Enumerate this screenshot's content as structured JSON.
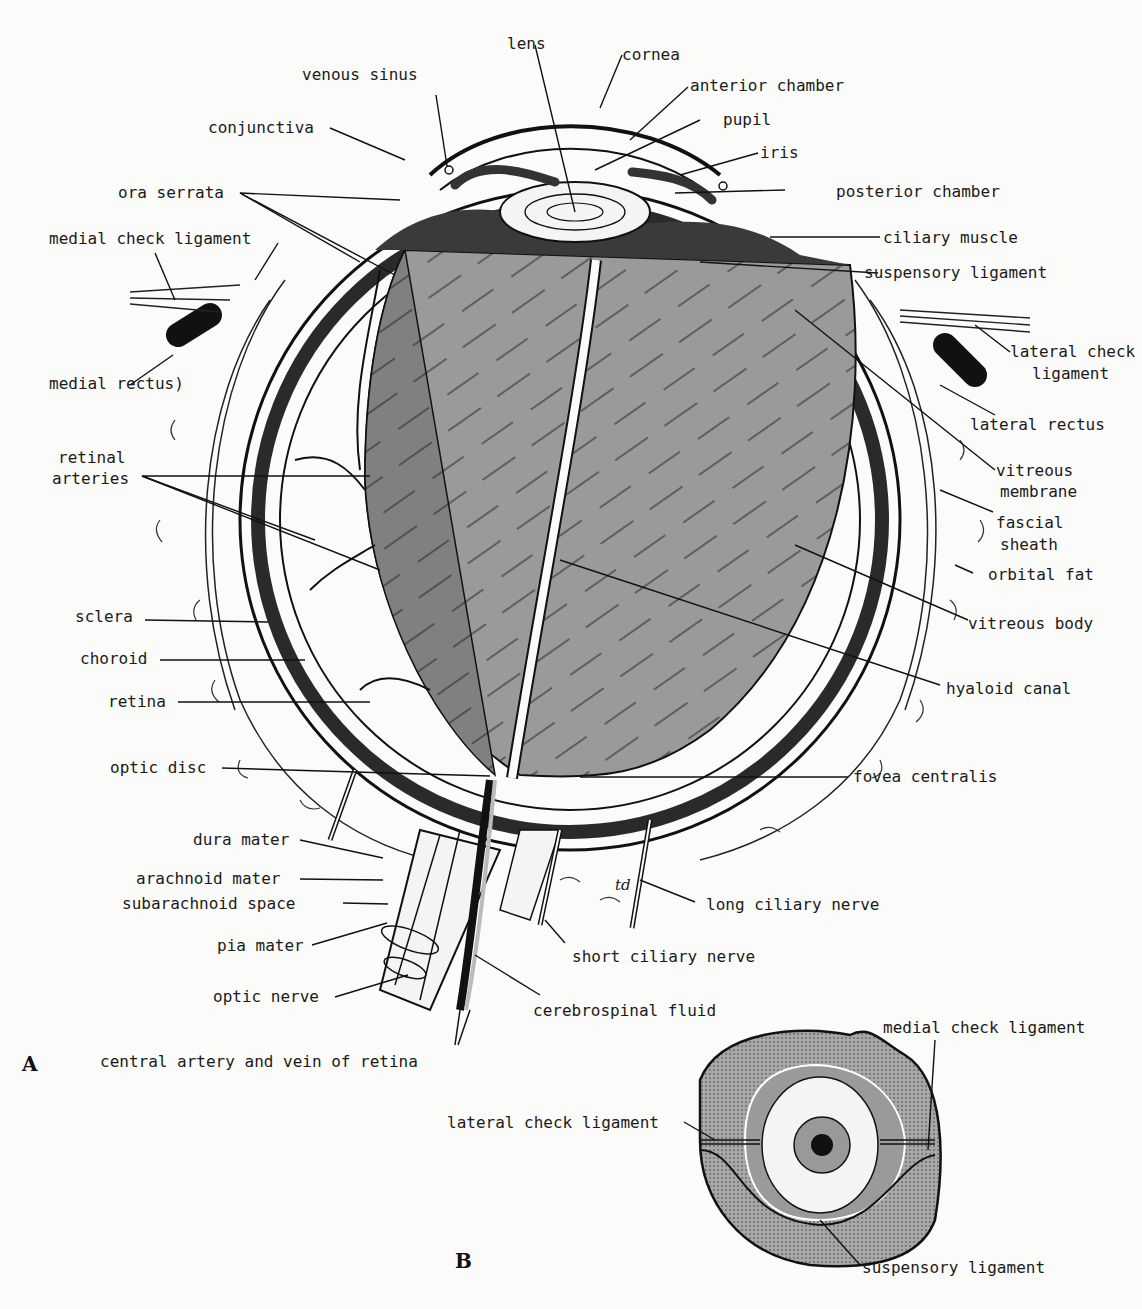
{
  "figure": {
    "panel_a": {
      "letter": "A",
      "labels": {
        "lens": "lens",
        "cornea": "cornea",
        "venous_sinus": "venous sinus",
        "anterior_chamber": "anterior chamber",
        "pupil": "pupil",
        "conjunctiva": "conjunctiva",
        "iris": "iris",
        "ora_serrata": "ora serrata",
        "posterior_chamber": "posterior chamber",
        "medial_check_ligament": "medial check ligament",
        "ciliary_muscle": "ciliary muscle",
        "suspensory_ligament": "suspensory ligament",
        "lateral_check_ligament_1": "lateral check",
        "lateral_check_ligament_2": "ligament",
        "medial_rectus": "medial rectus)",
        "lateral_rectus": "lateral rectus",
        "retinal_arteries_1": "retinal",
        "retinal_arteries_2": "arteries",
        "vitreous_membrane_1": "vitreous",
        "vitreous_membrane_2": "membrane",
        "fascial_sheath_1": "fascial",
        "fascial_sheath_2": "sheath",
        "orbital_fat": "orbital fat",
        "sclera": "sclera",
        "vitreous_body": "vitreous body",
        "choroid": "choroid",
        "hyaloid_canal": "hyaloid canal",
        "retina": "retina",
        "optic_disc": "optic disc",
        "fovea_centralis": "fovea centralis",
        "dura_mater": "dura mater",
        "arachnoid_mater": "arachnoid mater",
        "long_ciliary_nerve": "long ciliary nerve",
        "subarachnoid_space": "subarachnoid space",
        "pia_mater": "pia mater",
        "short_ciliary_nerve": "short ciliary nerve",
        "optic_nerve": "optic nerve",
        "cerebrospinal_fluid": "cerebrospinal fluid",
        "central_artery_vein": "central artery and vein of retina",
        "signature": "td"
      }
    },
    "panel_b": {
      "letter": "B",
      "labels": {
        "medial_check_ligament": "medial check ligament",
        "lateral_check_ligament": "lateral check ligament",
        "suspensory_ligament": "suspensory ligament"
      }
    }
  }
}
